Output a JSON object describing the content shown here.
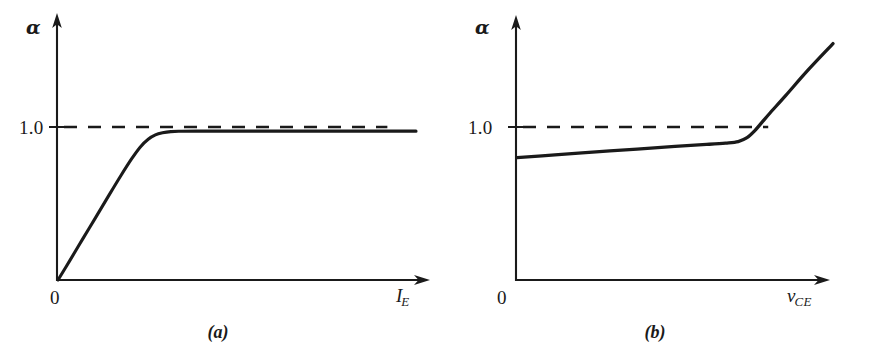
{
  "figure": {
    "background_color": "#ffffff",
    "ink_color": "#1a1a1a",
    "panels": [
      {
        "id": "a",
        "caption": "(a)",
        "y_axis_symbol": "α",
        "x_axis_symbol": "I",
        "x_axis_subscript": "E",
        "origin_label": "0",
        "y_tick_label": "1.0",
        "reference_line_label": "1.0"
      },
      {
        "id": "b",
        "caption": "(b)",
        "y_axis_symbol": "α",
        "x_axis_symbol": "v",
        "x_axis_subscript": "CE",
        "origin_label": "0",
        "y_tick_label": "1.0",
        "reference_line_label": "1.0"
      }
    ]
  },
  "chart_data": [
    {
      "type": "line",
      "panel": "a",
      "title": "",
      "xlabel": "I_E",
      "ylabel": "alpha",
      "xlim": [
        0,
        1
      ],
      "ylim": [
        0,
        1.32
      ],
      "grid": false,
      "legend": null,
      "yticks": [
        1.0
      ],
      "ytick_labels": [
        "1.0"
      ],
      "xticks": [
        0
      ],
      "xtick_labels": [
        "0"
      ],
      "annotations": [
        "(a)"
      ],
      "series": [
        {
          "name": "alpha vs emitter current",
          "style": "solid",
          "x": [
            0.0,
            0.035,
            0.07,
            0.105,
            0.14,
            0.175,
            0.205,
            0.23,
            0.252,
            0.272,
            0.292,
            0.315,
            0.345,
            0.39,
            0.45,
            0.54,
            0.65,
            0.78,
            0.9,
            1.0
          ],
          "y": [
            0.0,
            0.135,
            0.272,
            0.408,
            0.545,
            0.68,
            0.79,
            0.87,
            0.92,
            0.948,
            0.962,
            0.97,
            0.972,
            0.973,
            0.973,
            0.973,
            0.973,
            0.973,
            0.973,
            0.973
          ]
        },
        {
          "name": "alpha = 1.0 reference",
          "style": "dashed",
          "x": [
            0.0,
            0.92
          ],
          "y": [
            1.0,
            1.0
          ]
        }
      ]
    },
    {
      "type": "line",
      "panel": "b",
      "title": "",
      "xlabel": "v_CE",
      "ylabel": "alpha",
      "xlim": [
        0,
        1
      ],
      "ylim": [
        0,
        1.32
      ],
      "grid": false,
      "legend": null,
      "yticks": [
        1.0
      ],
      "ytick_labels": [
        "1.0"
      ],
      "xticks": [
        0
      ],
      "xtick_labels": [
        "0"
      ],
      "annotations": [
        "(b)"
      ],
      "series": [
        {
          "name": "alpha vs collector-emitter voltage",
          "style": "solid",
          "x": [
            0.0,
            0.12,
            0.25,
            0.38,
            0.5,
            0.6,
            0.66,
            0.7,
            0.728,
            0.752,
            0.775,
            0.8,
            0.85,
            0.92,
            1.0
          ],
          "y": [
            0.8,
            0.818,
            0.838,
            0.856,
            0.873,
            0.886,
            0.895,
            0.905,
            0.93,
            0.975,
            1.03,
            1.09,
            1.205,
            1.37,
            1.545
          ]
        },
        {
          "name": "alpha = 1.0 reference",
          "style": "dashed",
          "x": [
            0.0,
            0.795
          ],
          "y": [
            1.0,
            1.0
          ]
        }
      ]
    }
  ]
}
